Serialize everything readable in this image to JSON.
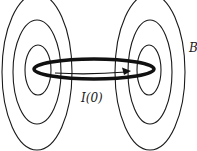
{
  "diagram": {
    "labels": {
      "current": "I(0)",
      "field": "B"
    },
    "colors": {
      "stroke": "#1a1a1a",
      "background": "#ffffff"
    },
    "elements": [
      {
        "name": "current-loop",
        "shape": "ellipse",
        "cx": 94,
        "cy": 69,
        "rx": 61,
        "ry": 10,
        "stroke_width": 3.5
      },
      {
        "name": "current-arrow",
        "shape": "arrow",
        "from": [
          55,
          73
        ],
        "to": [
          131,
          73
        ]
      },
      {
        "name": "left-field-lines",
        "shape": "concentric-ellipses",
        "cx": 37,
        "cy": 72,
        "radii": [
          [
            35,
            78
          ],
          [
            24,
            52
          ],
          [
            13,
            25
          ]
        ]
      },
      {
        "name": "right-field-lines",
        "shape": "concentric-ellipses",
        "cx": 150,
        "cy": 72,
        "radii": [
          [
            35,
            78
          ],
          [
            22,
            52
          ],
          [
            12,
            25
          ]
        ]
      }
    ]
  }
}
